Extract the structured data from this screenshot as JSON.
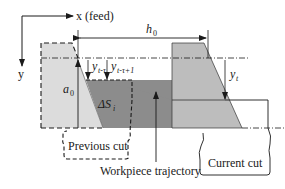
{
  "diagram": {
    "axes": {
      "x_label": "x (feed)",
      "y_label": "y"
    },
    "labels": {
      "h0": "h",
      "h0_sub": "0",
      "a0": "a",
      "a0_sub": "0",
      "y_t_tau": "y",
      "y_t_tau_sub": "t-τ",
      "y_t_tau_1": "y",
      "y_t_tau_1_sub": "t-τ+1",
      "y_t": "y",
      "y_t_sub": "t",
      "delta_s": "ΔS",
      "delta_s_sub": "i",
      "previous_cut": "Previous cut",
      "current_cut": "Current cut",
      "workpiece_trajectory": "Workpiece trajectory"
    },
    "colors": {
      "previous_tool_fill": "#dcdcdc",
      "removed_material_fill": "#8c8c8c",
      "current_tool_fill": "#bdbdbd",
      "stroke": "#1a1a1a",
      "background": "#ffffff"
    }
  }
}
